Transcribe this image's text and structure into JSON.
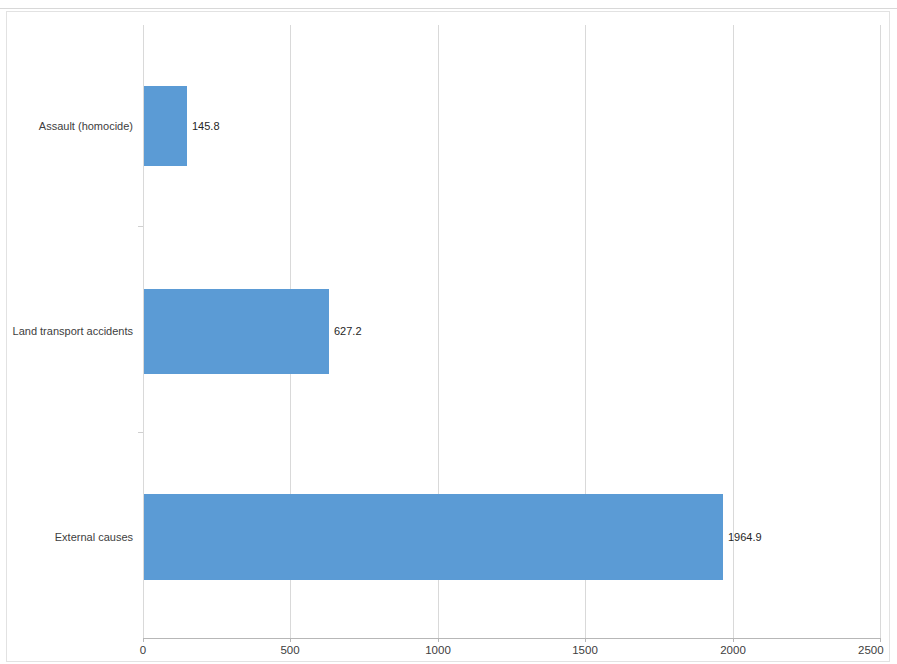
{
  "chart_data": {
    "type": "bar",
    "orientation": "horizontal",
    "title": "",
    "subtitle": "",
    "xlabel": "",
    "ylabel": "",
    "categories": [
      "Assault (homocide)",
      "Land transport accidents",
      "External causes"
    ],
    "values": [
      145.8,
      627.2,
      1964.9
    ],
    "data_labels": [
      "145.8",
      "627.2",
      "1964.9"
    ],
    "xlim": [
      0,
      2500
    ],
    "xticks": [
      0,
      500,
      1000,
      1500,
      2000,
      2500
    ],
    "xtick_labels": [
      "0",
      "500",
      "1000",
      "1500",
      "2000",
      "2500"
    ],
    "grid": true,
    "grid_axis": "x",
    "legend": false,
    "legend_position": "none",
    "series": [
      {
        "name": "",
        "color": "#5B9BD5",
        "values": [
          145.8,
          627.2,
          1964.9
        ]
      }
    ]
  },
  "style": {
    "bar_color": "#5B9BD5",
    "gridline_color": "#D9D9D9",
    "axis_color": "#B7B7B7",
    "frame_color": "#E2E2E2",
    "label_color": "#404040",
    "data_label_color": "#262626",
    "background": "#FFFFFF"
  }
}
